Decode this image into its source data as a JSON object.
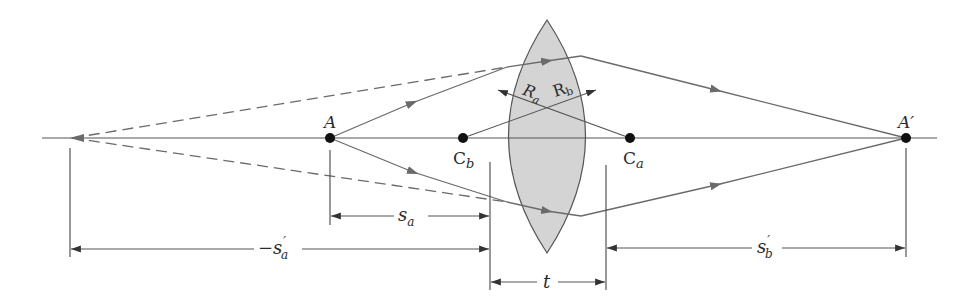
{
  "figure": {
    "type": "thick-lens-ray-diagram",
    "colors": {
      "background": "#ffffff",
      "lens_fill": "#d4d4d4",
      "lens_outline": "#555555",
      "rays": "#6a6a6a",
      "points": "#111111",
      "text": "#2b2b2b"
    }
  },
  "points": {
    "object": {
      "label": "A"
    },
    "image": {
      "label": "A′"
    },
    "center_b": {
      "label": "C",
      "sub": "b"
    },
    "center_a": {
      "label": "C",
      "sub": "a"
    }
  },
  "radii": {
    "ra": {
      "label": "R",
      "sub": "a"
    },
    "rb": {
      "label": "R",
      "sub": "b"
    }
  },
  "dimensions": {
    "sa": {
      "label": "s",
      "sub": "a"
    },
    "neg_sa_prime": {
      "prefix": "−",
      "label": "s",
      "prime": "′",
      "sub": "a"
    },
    "sb_prime": {
      "label": "s",
      "prime": "′",
      "sub": "b"
    },
    "thickness": {
      "label": "t"
    }
  }
}
